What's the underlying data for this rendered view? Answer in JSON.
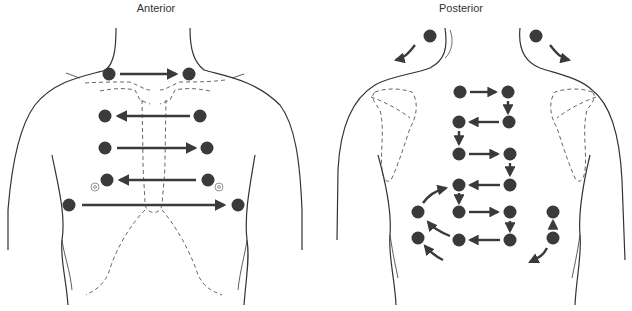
{
  "figure": {
    "panels": [
      {
        "id": "anterior",
        "label": "Anterior"
      },
      {
        "id": "posterior",
        "label": "Posterior"
      }
    ]
  },
  "colors": {
    "dot": "#3a3a3a",
    "arrow": "#3a3a3a",
    "outline": "#333333",
    "dashed": "#555555",
    "background": "#ffffff"
  },
  "anterior": {
    "sequence": [
      {
        "step": 1,
        "from": "left-supraclavicular",
        "to": "right-supraclavicular",
        "direction": "right"
      },
      {
        "step": 2,
        "from": "right-upper-chest",
        "to": "left-upper-chest",
        "direction": "left"
      },
      {
        "step": 3,
        "from": "left-mid-chest",
        "to": "right-mid-chest",
        "direction": "right"
      },
      {
        "step": 4,
        "from": "right-lower-chest",
        "to": "left-lower-chest",
        "direction": "left"
      },
      {
        "step": 5,
        "from": "left-lateral",
        "to": "right-lateral",
        "direction": "right"
      }
    ]
  },
  "posterior": {
    "sequence": [
      {
        "step": 1,
        "from": "left-shoulder",
        "direction": "down-left"
      },
      {
        "step": 2,
        "from": "right-shoulder",
        "direction": "down-right"
      },
      {
        "step": 3,
        "from": "row1-left",
        "to": "row1-right",
        "direction": "right"
      },
      {
        "step": 4,
        "from": "row1-right",
        "to": "row2-right",
        "direction": "down"
      },
      {
        "step": 5,
        "from": "row2-right",
        "to": "row2-left",
        "direction": "left"
      },
      {
        "step": 6,
        "from": "row2-left",
        "to": "row3-left",
        "direction": "down"
      },
      {
        "step": 7,
        "from": "row3-left",
        "to": "row3-right",
        "direction": "right"
      },
      {
        "step": 8,
        "from": "row3-right",
        "to": "row4-right",
        "direction": "down"
      },
      {
        "step": 9,
        "from": "row4-right",
        "to": "row4-left",
        "direction": "left"
      },
      {
        "step": 10,
        "from": "row4-left",
        "to": "row5-left",
        "direction": "down"
      },
      {
        "step": 11,
        "from": "row5-left",
        "to": "row5-right",
        "direction": "right"
      },
      {
        "step": 12,
        "from": "row5-right",
        "to": "row6-right",
        "direction": "down"
      },
      {
        "step": 13,
        "from": "row6-right",
        "to": "row6-left",
        "direction": "left"
      },
      {
        "step": 14,
        "from": "lateral-left-lower",
        "to": "lateral-left-upper",
        "direction": "curve-up"
      },
      {
        "step": 15,
        "from": "lateral-right-lower",
        "to": "lateral-right-upper",
        "direction": "up"
      }
    ]
  }
}
